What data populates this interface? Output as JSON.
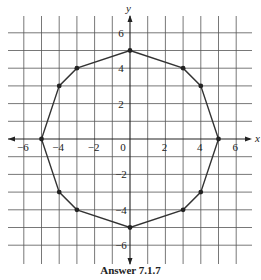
{
  "figure": {
    "caption": "Answer 7.1.7",
    "x_axis_label": "x",
    "y_axis_label": "y",
    "origin_label": "0"
  },
  "chart_data": {
    "type": "scatter",
    "title": "Answer 7.1.7",
    "xlabel": "x",
    "ylabel": "y",
    "xlim": [
      -7,
      7
    ],
    "ylim": [
      -7,
      7
    ],
    "grid": true,
    "x_ticks": [
      -6,
      -4,
      -2,
      0,
      2,
      4,
      6
    ],
    "x_tick_labels": [
      "−6",
      "−4",
      "−2",
      "0",
      "2",
      "4",
      "6"
    ],
    "y_ticks": [
      6,
      4,
      2,
      -2,
      -4,
      -6
    ],
    "y_tick_labels": [
      "6",
      "4",
      "2",
      "−2",
      "−4",
      "−6"
    ],
    "series": [
      {
        "name": "polygon",
        "closed": true,
        "points": [
          [
            0,
            5
          ],
          [
            3,
            4
          ],
          [
            4,
            3
          ],
          [
            5,
            0
          ],
          [
            4,
            -3
          ],
          [
            3,
            -4
          ],
          [
            0,
            -5
          ],
          [
            -3,
            -4
          ],
          [
            -4,
            -3
          ],
          [
            -5,
            0
          ],
          [
            -4,
            3
          ],
          [
            -3,
            4
          ]
        ]
      }
    ],
    "colors": {
      "grid": "#555555",
      "axis": "#222222",
      "polygon": "#333333",
      "points": "#222222"
    }
  }
}
